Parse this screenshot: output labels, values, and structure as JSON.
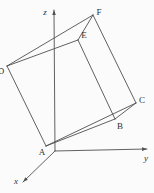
{
  "figure": {
    "width": 154,
    "height": 193,
    "background_color": "#fbfbfb",
    "line_color": "#4f4f4f",
    "label_color": "#303030",
    "line_width": 0.9,
    "label_font_size": 9,
    "vertices": {
      "A": {
        "x": 46,
        "y": 146
      },
      "B": {
        "x": 115,
        "y": 119
      },
      "C": {
        "x": 136,
        "y": 103
      },
      "D": {
        "x": 7,
        "y": 66
      },
      "E": {
        "x": 78,
        "y": 40
      },
      "F": {
        "x": 93,
        "y": 15
      }
    },
    "vertex_labels": [
      {
        "text": "A",
        "x": 42,
        "y": 155
      },
      {
        "text": "B",
        "x": 120,
        "y": 129
      },
      {
        "text": "C",
        "x": 142,
        "y": 103
      },
      {
        "text": "D",
        "x": 1,
        "y": 74
      },
      {
        "text": "E",
        "x": 84,
        "y": 38
      },
      {
        "text": "F",
        "x": 99,
        "y": 15
      }
    ],
    "edges": [
      {
        "from": "D",
        "to": "E"
      },
      {
        "from": "E",
        "to": "F"
      },
      {
        "from": "D",
        "to": "F"
      },
      {
        "from": "A",
        "to": "B"
      },
      {
        "from": "B",
        "to": "C"
      },
      {
        "from": "A",
        "to": "C"
      },
      {
        "from": "D",
        "to": "A"
      },
      {
        "from": "E",
        "to": "B"
      },
      {
        "from": "F",
        "to": "C"
      }
    ],
    "axes": [
      {
        "name": "z",
        "label": "z",
        "x1": 55,
        "y1": 151,
        "x2": 54,
        "y2": 10,
        "label_x": 45,
        "label_y": 15
      },
      {
        "name": "y",
        "label": "y",
        "x1": 55,
        "y1": 151,
        "x2": 147,
        "y2": 149,
        "label_x": 146,
        "label_y": 161
      },
      {
        "name": "x",
        "label": "x",
        "x1": 55,
        "y1": 151,
        "x2": 23,
        "y2": 182,
        "label_x": 16,
        "label_y": 184
      }
    ]
  }
}
